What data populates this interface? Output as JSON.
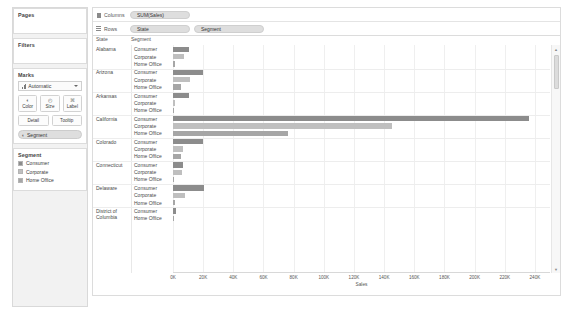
{
  "sidebar": {
    "pages": {
      "title": "Pages"
    },
    "filters": {
      "title": "Filters"
    },
    "marks": {
      "title": "Marks",
      "mark_type": "Automatic",
      "buttons": [
        {
          "name": "color",
          "label": "Color",
          "icon": "◐"
        },
        {
          "name": "size",
          "label": "Size",
          "icon": "◴"
        },
        {
          "name": "label",
          "label": "Label",
          "icon": "⌘"
        }
      ],
      "buttons2": [
        {
          "name": "detail",
          "label": "Detail"
        },
        {
          "name": "tooltip",
          "label": "Tooltip"
        }
      ],
      "pill": {
        "label": "Segment",
        "icon": "◐"
      }
    },
    "legend": {
      "title": "Segment",
      "items": [
        {
          "label": "Consumer",
          "color": "#8c8c8c"
        },
        {
          "label": "Corporate",
          "color": "#bfbfbf"
        },
        {
          "label": "Home Office",
          "color": "#a6a6a6"
        }
      ]
    }
  },
  "shelves": {
    "columns": {
      "label": "Columns",
      "pills": [
        "SUM(Sales)"
      ]
    },
    "rows": {
      "label": "Rows",
      "pills": [
        "State",
        "Segment"
      ]
    }
  },
  "viz": {
    "header_state": "State",
    "header_segment": "Segment",
    "scrollbar": {
      "up": "▲",
      "down": "▼"
    }
  },
  "chart_data": {
    "type": "bar",
    "title": "",
    "xlabel": "Sales",
    "ylabel": "",
    "xlim": [
      0,
      250000
    ],
    "grid": true,
    "legend_position": "left-sidebar",
    "tick_labels": [
      "0K",
      "20K",
      "40K",
      "60K",
      "80K",
      "100K",
      "120K",
      "140K",
      "160K",
      "180K",
      "200K",
      "220K",
      "240K"
    ],
    "tick_values": [
      0,
      20000,
      40000,
      60000,
      80000,
      100000,
      120000,
      140000,
      160000,
      180000,
      200000,
      220000,
      240000
    ],
    "segments": [
      "Consumer",
      "Corporate",
      "Home Office"
    ],
    "segment_colors": {
      "Consumer": "#8c8c8c",
      "Corporate": "#bfbfbf",
      "Home Office": "#a6a6a6"
    },
    "groups": [
      {
        "state": "Alabama",
        "values": {
          "Consumer": 10800,
          "Corporate": 7300,
          "Home Office": 1000
        }
      },
      {
        "state": "Arizona",
        "values": {
          "Consumer": 19700,
          "Corporate": 11100,
          "Home Office": 5600
        }
      },
      {
        "state": "Arkansas",
        "values": {
          "Consumer": 10600,
          "Corporate": 1200,
          "Home Office": 0
        }
      },
      {
        "state": "California",
        "values": {
          "Consumer": 236000,
          "Corporate": 145000,
          "Home Office": 76500
        }
      },
      {
        "state": "Colorado",
        "values": {
          "Consumer": 19700,
          "Corporate": 6800,
          "Home Office": 5400
        }
      },
      {
        "state": "Connecticut",
        "values": {
          "Consumer": 6500,
          "Corporate": 6200,
          "Home Office": 900
        }
      },
      {
        "state": "Delaware",
        "values": {
          "Consumer": 20500,
          "Corporate": 7800,
          "Home Office": 1100
        }
      },
      {
        "state": "District of Columbia",
        "values": {
          "Consumer": 2000,
          "Home Office": 0
        }
      }
    ]
  }
}
